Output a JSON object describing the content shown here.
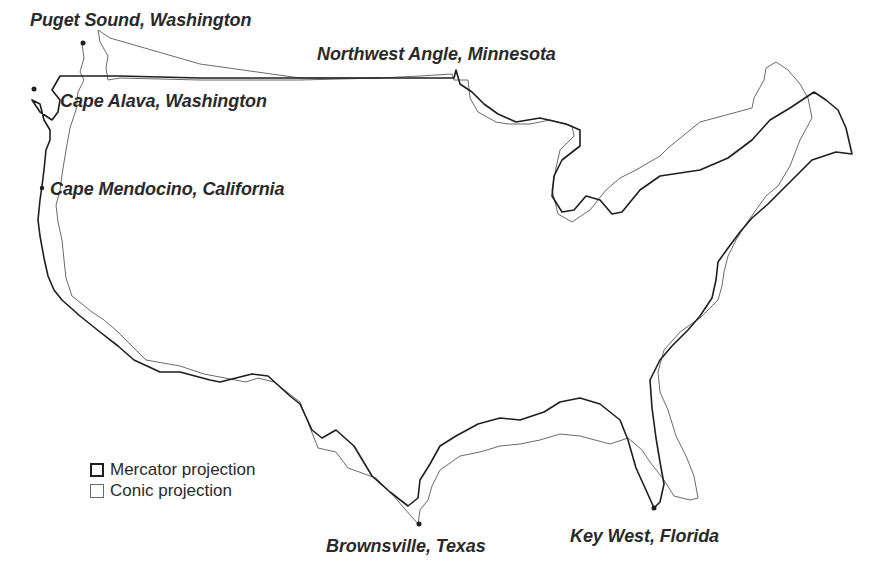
{
  "map": {
    "subject": "Contiguous United States outline comparison",
    "colors": {
      "mercator_stroke": "#1e1e1e",
      "conic_stroke": "#6a6a6a",
      "label_text": "#2a2a2a",
      "background": "#ffffff"
    },
    "labels": {
      "puget_sound": "Puget Sound, Washington",
      "northwest_angle": "Northwest Angle, Minnesota",
      "cape_alava": "Cape Alava, Washington",
      "cape_mendocino": "Cape Mendocino, California",
      "brownsville": "Brownsville, Texas",
      "key_west": "Key West, Florida"
    },
    "legend": {
      "items": [
        {
          "label": "Mercator projection",
          "style": "thick-dark-outline"
        },
        {
          "label": "Conic projection",
          "style": "thin-gray-outline"
        }
      ]
    }
  }
}
